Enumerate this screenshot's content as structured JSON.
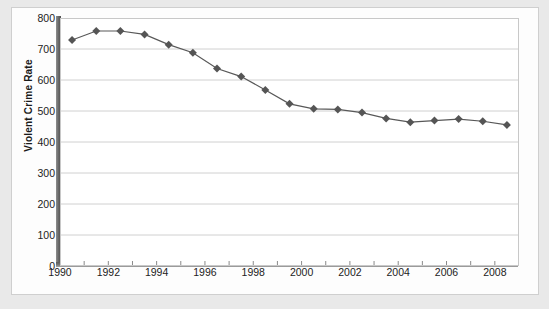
{
  "chart_data": {
    "type": "line",
    "title": "",
    "xlabel": "",
    "ylabel": "Violent Crime Rate",
    "xlim": [
      1990,
      2009
    ],
    "ylim": [
      0,
      800
    ],
    "grid": true,
    "legend": "none",
    "marker": "diamond",
    "series_color": "#585858",
    "x": [
      1990,
      1991,
      1992,
      1993,
      1994,
      1995,
      1996,
      1997,
      1998,
      1999,
      2000,
      2001,
      2002,
      2003,
      2004,
      2005,
      2006,
      2007,
      2008
    ],
    "values": [
      729,
      758,
      758,
      747,
      714,
      688,
      637,
      611,
      568,
      523,
      507,
      505,
      495,
      476,
      464,
      469,
      474,
      467,
      455
    ],
    "series": [
      {
        "name": "Violent Crime Rate",
        "values": [
          729,
          758,
          758,
          747,
          714,
          688,
          637,
          611,
          568,
          523,
          507,
          505,
          495,
          476,
          464,
          469,
          474,
          467,
          455
        ]
      }
    ],
    "y_ticks": [
      0,
      100,
      200,
      300,
      400,
      500,
      600,
      700,
      800
    ],
    "y_tick_labels": [
      "0",
      "100",
      "200",
      "300",
      "400",
      "500",
      "600",
      "700",
      "800"
    ],
    "x_ticks": [
      1990,
      1992,
      1994,
      1996,
      1998,
      2000,
      2002,
      2004,
      2006,
      2008
    ],
    "x_tick_labels": [
      "1990",
      "1992",
      "1994",
      "1996",
      "1998",
      "2000",
      "2002",
      "2004",
      "2006",
      "2008"
    ],
    "x_minor_ticks": [
      1991,
      1993,
      1995,
      1997,
      1999,
      2001,
      2003,
      2005,
      2007
    ],
    "colors": {
      "line": "#585858",
      "marker": "#555555",
      "grid": "#d0d0d0",
      "axis": "#5a5a5a",
      "plot_background": "#ffffff",
      "page_background": "#e9e9e9",
      "card_background": "#fdfdfd",
      "text": "#222222"
    }
  }
}
